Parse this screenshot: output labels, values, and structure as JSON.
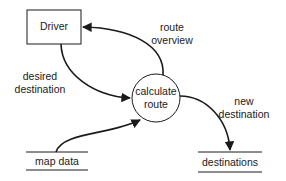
{
  "diagram": {
    "type": "data-flow-diagram",
    "entities": [
      {
        "id": "driver",
        "kind": "external-entity",
        "label": "Driver"
      }
    ],
    "processes": [
      {
        "id": "calculate_route",
        "kind": "process",
        "label_lines": [
          "calculate",
          "route"
        ]
      }
    ],
    "data_stores": [
      {
        "id": "map_data",
        "kind": "data-store",
        "label": "map data"
      },
      {
        "id": "destinations",
        "kind": "data-store",
        "label": "destinations"
      }
    ],
    "flows": [
      {
        "id": "desired_destination",
        "from": "driver",
        "to": "calculate_route",
        "label_lines": [
          "desired",
          "destination"
        ]
      },
      {
        "id": "route_overview",
        "from": "calculate_route",
        "to": "driver",
        "label_lines": [
          "route",
          "overview"
        ]
      },
      {
        "id": "new_destination",
        "from": "calculate_route",
        "to": "destinations",
        "label_lines": [
          "new",
          "destination"
        ]
      },
      {
        "id": "map_data_flow",
        "from": "map_data",
        "to": "calculate_route",
        "label_lines": []
      }
    ],
    "colors": {
      "stroke": "#1a1a1a",
      "background": "#ffffff"
    }
  }
}
